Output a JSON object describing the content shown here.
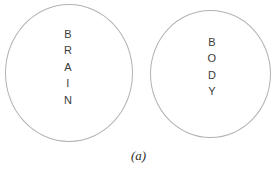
{
  "figure": {
    "caption": "(a)",
    "background_color": "#ffffff",
    "stroke_color": "#b2b2b2",
    "text_color": "#3b3b3b",
    "caption_color": "#2e2e2e",
    "shapes": [
      {
        "id": "brain",
        "shape": "circle",
        "label": "BRAIN",
        "label_orientation": "vertical-stacked",
        "letters": [
          "B",
          "R",
          "A",
          "I",
          "N"
        ]
      },
      {
        "id": "body",
        "shape": "circle",
        "label": "BODY",
        "label_orientation": "vertical-stacked",
        "letters": [
          "B",
          "O",
          "D",
          "Y"
        ]
      }
    ]
  }
}
